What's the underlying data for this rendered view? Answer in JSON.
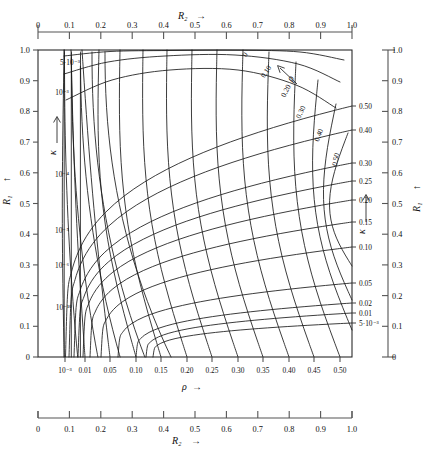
{
  "figure": {
    "kind": "nomogram"
  },
  "axes": {
    "top": {
      "name": "R2",
      "name_display": "R₂",
      "arrow": "→",
      "ticks": [
        "0",
        "0.1",
        "0.2",
        "0.3",
        "0.4",
        "0.5",
        "0.6",
        "0.7",
        "0.8",
        "0.9",
        "1.0"
      ],
      "values": [
        0,
        0.1,
        0.2,
        0.3,
        0.4,
        0.5,
        0.6,
        0.7,
        0.8,
        0.9,
        1.0
      ],
      "range": [
        0,
        1.0
      ]
    },
    "left": {
      "name": "R1",
      "name_display": "R₁",
      "arrow": "↑",
      "ticks": [
        "0",
        "0.1",
        "0.2",
        "0.3",
        "0.4",
        "0.5",
        "0.6",
        "0.7",
        "0.8",
        "0.9",
        "1.0"
      ],
      "values": [
        0,
        0.1,
        0.2,
        0.3,
        0.4,
        0.5,
        0.6,
        0.7,
        0.8,
        0.9,
        1.0
      ],
      "range": [
        0,
        1.0
      ]
    },
    "right": {
      "name": "R1",
      "name_display": "R₁",
      "arrow": "↑",
      "ticks": [
        "0",
        "0.1",
        "0.2",
        "0.3",
        "0.4",
        "0.5",
        "0.6",
        "0.7",
        "0.8",
        "0.9",
        "1.0"
      ],
      "values": [
        0,
        0.1,
        0.2,
        0.3,
        0.4,
        0.5,
        0.6,
        0.7,
        0.8,
        0.9,
        1.0
      ],
      "range": [
        0,
        1.0
      ]
    },
    "bottom_plot": {
      "name": "rho",
      "name_display": "ρ",
      "arrow": "→",
      "ticks": [
        "10⁻³",
        "0.01",
        "0.05",
        "0.10",
        "0.15",
        "0.20",
        "0.25",
        "0.30",
        "0.35",
        "0.40",
        "0.45",
        "0.50"
      ],
      "values": [
        0.001,
        0.01,
        0.05,
        0.1,
        0.15,
        0.2,
        0.25,
        0.3,
        0.35,
        0.4,
        0.45,
        0.5
      ]
    },
    "bottom_rule": {
      "name": "R2",
      "name_display": "R₂",
      "arrow": "→",
      "ticks": [
        "0",
        "0.1",
        "0.2",
        "0.3",
        "0.4",
        "0.5",
        "0.6",
        "0.7",
        "0.8",
        "0.9",
        "1.0"
      ],
      "values": [
        0,
        0.1,
        0.2,
        0.3,
        0.4,
        0.5,
        0.6,
        0.7,
        0.8,
        0.9,
        1.0
      ],
      "range": [
        0,
        1.0
      ]
    }
  },
  "chart_data": {
    "type": "line",
    "title": "",
    "xlabel": "ρ",
    "ylabel": "R₁",
    "xlim": [
      0,
      0.5
    ],
    "ylim": [
      0,
      1.0
    ],
    "grid": false,
    "legend_position": "none",
    "families": [
      {
        "name": "kappa",
        "symbol": "κ",
        "description": "Curves of constant κ, labelled on the right-hand inner scale and on the inner left of the frame",
        "right_scale_labels": [
          "0.50",
          "0.40",
          "0.30",
          "0.25",
          "0.20",
          "0.15",
          "0.10",
          "0.05",
          "0.02",
          "0.01",
          "5·10⁻³"
        ],
        "right_scale_values": [
          0.5,
          0.4,
          0.3,
          0.25,
          0.2,
          0.15,
          0.1,
          0.05,
          0.02,
          0.01,
          0.005
        ],
        "inner_left_labels": [
          "5·10⁻³",
          "10⁻³",
          "10⁻⁴",
          "10⁻⁵",
          "10⁻⁶",
          "10⁻¹⁰"
        ],
        "inner_left_values": [
          0.005,
          0.001,
          0.0001,
          1e-05,
          1e-06,
          1e-10
        ]
      },
      {
        "name": "rho",
        "symbol": "ρ",
        "description": "Curves of constant ρ, labelled along the upper-right arc",
        "arc_labels": [
          "0",
          "0.10",
          "0.20",
          "0.30",
          "0.40",
          "0.50"
        ],
        "arc_values": [
          0,
          0.1,
          0.2,
          0.3,
          0.4,
          0.5
        ]
      }
    ]
  },
  "annotations": {
    "kappa_arrow_left": {
      "symbol": "κ",
      "arrow": "↑"
    },
    "kappa_arrow_right": {
      "symbol": "κ",
      "arrow": "↑"
    },
    "rho_arrow_arc": {
      "symbol": "ρ",
      "arrow": "↖"
    },
    "rho_axis": {
      "symbol": "ρ",
      "arrow": "→"
    }
  },
  "colors": {
    "ink": "#1a1a1a",
    "rule": "#555555",
    "background": "#ffffff"
  }
}
